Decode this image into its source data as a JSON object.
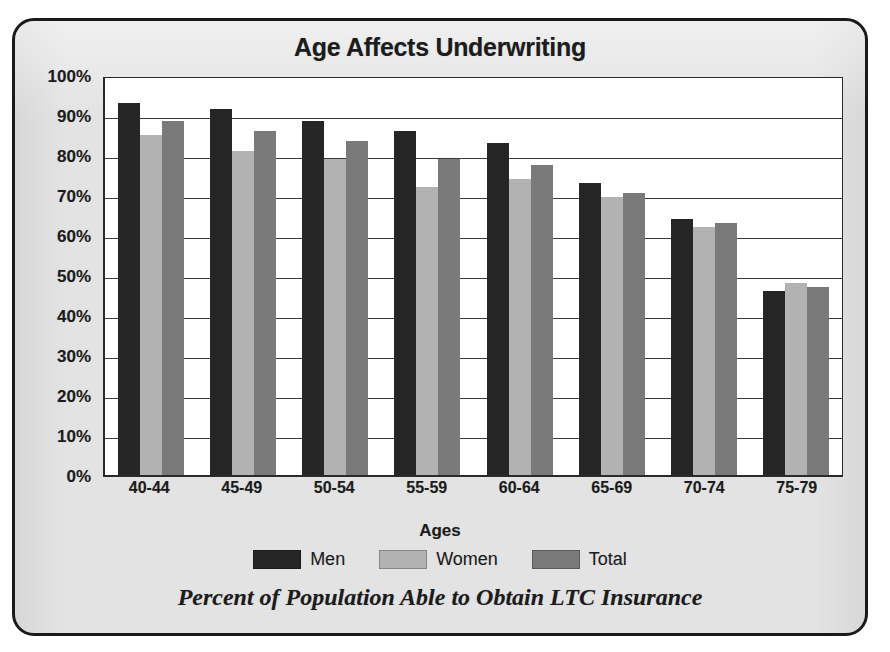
{
  "chart_data": {
    "type": "bar",
    "title": "Age Affects Underwriting",
    "caption": "Percent of Population Able to Obtain LTC Insurance",
    "xlabel": "Ages",
    "ylabel": "",
    "categories": [
      "40-44",
      "45-49",
      "50-54",
      "55-59",
      "60-64",
      "65-69",
      "70-74",
      "75-79"
    ],
    "series": [
      {
        "name": "Men",
        "color": "#262626",
        "values": [
          93,
          91.5,
          88.5,
          86,
          83,
          73,
          64,
          46
        ]
      },
      {
        "name": "Women",
        "color": "#b2b2b2",
        "values": [
          85,
          81,
          79,
          72,
          74,
          69.5,
          62,
          48
        ]
      },
      {
        "name": "Total",
        "color": "#7a7a7a",
        "values": [
          88.5,
          86,
          83.5,
          79,
          77.5,
          70.5,
          63,
          47
        ]
      }
    ],
    "ylim": [
      0,
      100
    ],
    "ytick_labels": [
      "100%",
      "90%",
      "80%",
      "70%",
      "60%",
      "50%",
      "40%",
      "30%",
      "20%",
      "10%",
      "0%"
    ],
    "ytick_values": [
      100,
      90,
      80,
      70,
      60,
      50,
      40,
      30,
      20,
      10,
      0
    ],
    "grid": true,
    "legend_position": "bottom"
  },
  "legend": {
    "items": [
      {
        "label": "Men"
      },
      {
        "label": "Women"
      },
      {
        "label": "Total"
      }
    ]
  }
}
